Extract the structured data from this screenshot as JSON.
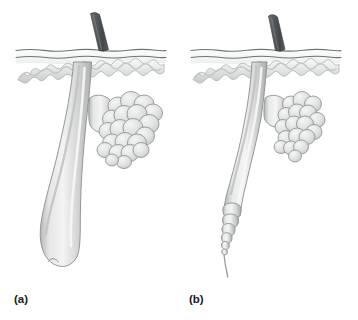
{
  "figure": {
    "background_color": "#ffffff",
    "panels": [
      {
        "id": "a",
        "label": "(a)",
        "phase_name": "anagen",
        "description": "Actively growing hair follicle with long follicle shaft and rounded bulb at base",
        "label_x": 14,
        "label_y": 302,
        "origin_x": 0,
        "hair_shaft_visible": true,
        "follicle_base": "rounded-bulb",
        "sebaceous_gland_size": "large"
      },
      {
        "id": "b",
        "label": "(b)",
        "phase_name": "catagen",
        "description": "Regressing hair follicle, shortened with tapering segmented base ending in a thin strand",
        "label_x": 189,
        "label_y": 302,
        "origin_x": 175,
        "hair_shaft_visible": true,
        "follicle_base": "tapered-club",
        "sebaceous_gland_size": "small"
      }
    ],
    "structures": [
      {
        "name": "hair-shaft",
        "color": "#5b5f61"
      },
      {
        "name": "epidermis-surface-line",
        "color": "#6e7376"
      },
      {
        "name": "epidermis-band",
        "color": "#f2f3f4"
      },
      {
        "name": "dermal-epidermal-junction",
        "color": "#b9bcbe"
      },
      {
        "name": "hair-follicle",
        "color": "#d2d4d3"
      },
      {
        "name": "sebaceous-gland",
        "color": "#d8dad9"
      },
      {
        "name": "outline-stroke",
        "color": "#8d9193"
      }
    ],
    "colors": {
      "hair_shaft_dark": "#4c5052",
      "hair_shaft_light": "#72777a",
      "follicle_light": "#eceeed",
      "follicle_mid": "#d4d6d5",
      "follicle_shadow": "#a8abaa",
      "gland_light": "#e8eae9",
      "gland_mid": "#d0d3d2",
      "outline": "#8a8e90",
      "surface_line": "#6e7376",
      "label_text": "#1a1a1a",
      "background": "#ffffff"
    }
  }
}
